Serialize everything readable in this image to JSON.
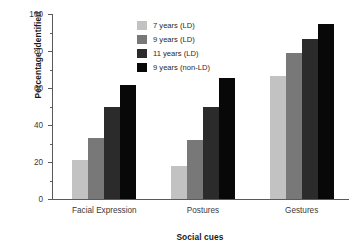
{
  "chart_data": {
    "type": "bar",
    "title": "",
    "xlabel": "Social cues",
    "ylabel": "Percentage identified",
    "categories": [
      "Facial Expression",
      "Postures",
      "Gestures"
    ],
    "ylim": [
      0,
      100
    ],
    "yticks": [
      0,
      20,
      40,
      60,
      80,
      100
    ],
    "ytick_labels": [
      "0",
      "20",
      "40",
      "60",
      "80",
      "100"
    ],
    "yminor_ticks": [
      10,
      30,
      50,
      70,
      90
    ],
    "grid": false,
    "legend_position": "upper center",
    "series": [
      {
        "name": "7 years (LD)",
        "color": "#c2c2c2",
        "values": [
          21,
          18,
          66.5
        ]
      },
      {
        "name": "9 years (LD)",
        "color": "#787878",
        "values": [
          33,
          32,
          79
        ]
      },
      {
        "name": "11 years (LD)",
        "color": "#2b2b2b",
        "values": [
          50,
          50,
          86.5
        ]
      },
      {
        "name": "9 years (non-LD)",
        "color": "#080808",
        "values": [
          61.5,
          65.5,
          94.5
        ]
      }
    ]
  },
  "axes": {
    "axis_color": "#5a5a5a"
  }
}
